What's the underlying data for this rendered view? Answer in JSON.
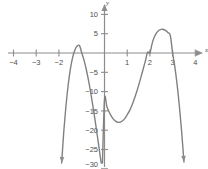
{
  "figure": {
    "title": "",
    "axis_color": "#8c8c8c",
    "curve_color": "#808080",
    "label_color": "#4d4d4d",
    "background": "#ffffff",
    "x_axis_name": "x",
    "y_axis_name": "y"
  },
  "chart_data": {
    "type": "line",
    "title": "",
    "xlabel": "x",
    "ylabel": "y",
    "xlim": [
      -4.5,
      4.6
    ],
    "ylim": [
      -31,
      12
    ],
    "grid": false,
    "legend": null,
    "x_ticks": [
      -4,
      -3,
      -2,
      1,
      2,
      3,
      4
    ],
    "x_tick_labels": [
      "−4",
      "−3",
      "−2",
      "1",
      "2",
      "3",
      "4"
    ],
    "y_ticks": [
      10,
      5,
      -5,
      -10,
      -15,
      -20,
      -25,
      -30
    ],
    "y_tick_labels": [
      "10",
      "5",
      "−5",
      "−10",
      "−15",
      "−20",
      "−25",
      "−30"
    ],
    "equation": "y = -2(x + 1)^2 (x - 2)(x - 3)",
    "roots": [
      -1,
      -1,
      2,
      3
    ],
    "y_intercept": -12,
    "local_maximum": {
      "x": 2.5,
      "y": 6
    },
    "local_minimum": {
      "x": 1.05,
      "y": -17.2
    },
    "double_root_touch": {
      "x": -1,
      "y": 0
    },
    "end_behavior": "down-down",
    "series": [
      {
        "name": "quartic",
        "x": [
          -2.0,
          -1.9,
          -1.8,
          -1.7,
          -1.6,
          -1.5,
          -1.4,
          -1.3,
          -1.2,
          -1.1,
          -1.0,
          -0.9,
          -0.8,
          -0.7,
          -0.6,
          -0.5,
          -0.4,
          -0.3,
          -0.2,
          -0.1,
          0.0,
          0.1,
          0.2,
          0.3,
          0.4,
          0.5,
          0.6,
          0.7,
          0.8,
          0.9,
          1.0,
          1.1,
          1.2,
          1.3,
          1.4,
          1.5,
          1.6,
          1.7,
          1.8,
          1.9,
          2.0,
          2.1,
          2.2,
          2.3,
          2.4,
          2.5,
          2.6,
          2.7,
          2.8,
          2.9,
          3.0,
          3.1,
          3.2,
          3.3,
          3.4,
          3.5
        ],
        "y": [
          -40.0,
          -29.56,
          -20.9,
          -13.85,
          -8.29,
          -4.06,
          -1.06,
          0.84,
          1.79,
          1.9,
          0.0,
          -1.9,
          -4.34,
          -7.25,
          -10.55,
          -14.17,
          -18.04,
          -22.08,
          -26.23,
          -30.43,
          -12.0,
          -13.77,
          -15.22,
          -16.36,
          -17.19,
          -17.72,
          -17.95,
          -17.89,
          -17.55,
          -16.94,
          -16.0,
          -14.99,
          -13.66,
          -12.11,
          -10.36,
          -8.44,
          -6.39,
          -4.24,
          -2.04,
          0.19,
          0.0,
          2.5,
          4.19,
          5.27,
          5.88,
          6.13,
          6.09,
          5.8,
          5.27,
          4.51,
          0.0,
          -3.66,
          -8.26,
          -13.86,
          -20.5,
          -28.22
        ]
      }
    ]
  }
}
